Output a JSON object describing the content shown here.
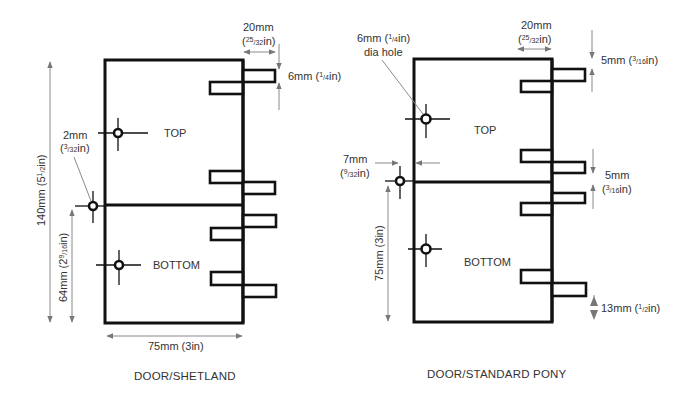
{
  "diagrams": [
    {
      "id": "shetland",
      "caption": "DOOR/SHETLAND",
      "panel_labels": {
        "top": "TOP",
        "bottom": "BOTTOM"
      },
      "dimensions": {
        "tab_length": {
          "mm": "20mm",
          "in_open": "(",
          "in_num": "25",
          "in_den": "32",
          "in_unit": "in)"
        },
        "tab_height": {
          "mm": "6mm",
          "in_open": "(",
          "in_num": "1",
          "in_den": "4",
          "in_unit": "in)"
        },
        "hole_dia": {
          "mm": "2mm",
          "in_open": "(",
          "in_num": "3",
          "in_den": "32",
          "in_unit": "in)"
        },
        "total_height": {
          "text": "140mm (5",
          "num": "1",
          "den": "2",
          "unit": "in)"
        },
        "hole_height": {
          "text": "64mm (2",
          "num": "9",
          "den": "16",
          "unit": "in)"
        },
        "width": {
          "text": "75mm (3in)"
        }
      }
    },
    {
      "id": "standard-pony",
      "caption": "DOOR/STANDARD PONY",
      "panel_labels": {
        "top": "TOP",
        "bottom": "BOTTOM"
      },
      "dimensions": {
        "hole_note": {
          "mm": "6mm (",
          "in_num": "1",
          "in_den": "4",
          "in_unit": "in)",
          "line2": "dia hole"
        },
        "tab_length": {
          "mm": "20mm",
          "in_open": "(",
          "in_num": "25",
          "in_den": "32",
          "in_unit": "in)"
        },
        "top_gap": {
          "mm": "5mm (",
          "in_num": "3",
          "in_den": "16",
          "in_unit": "in)"
        },
        "mid_gap": {
          "mm": "5mm",
          "in_open": "(",
          "in_num": "3",
          "in_den": "16",
          "in_unit": "in)"
        },
        "hole_offset": {
          "mm": "7mm",
          "in_open": "(",
          "in_num": "9",
          "in_den": "32",
          "in_unit": "in)"
        },
        "height": {
          "text": "75mm (3in)"
        },
        "bottom_gap": {
          "mm": "13mm (",
          "in_num": "1",
          "in_den": "2",
          "in_unit": "in)"
        }
      }
    }
  ]
}
